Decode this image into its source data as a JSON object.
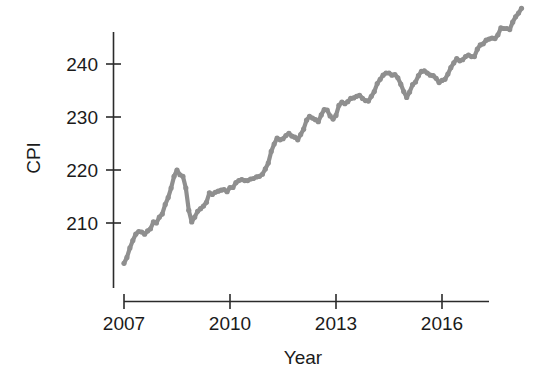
{
  "chart_data": {
    "type": "line",
    "title": "",
    "xlabel": "Year",
    "ylabel": "CPI",
    "xlim": [
      2006.92,
      2018.25
    ],
    "ylim": [
      201.0,
      247.2
    ],
    "grid": false,
    "legend": null,
    "series_color": "#8f8f8f",
    "axis_color": "#2b2b2b",
    "xticks": [
      2007,
      2010,
      2013,
      2016
    ],
    "xtick_labels": [
      "2007",
      "2010",
      "2013",
      "2016"
    ],
    "yticks": [
      210,
      220,
      230,
      240
    ],
    "ytick_labels": [
      "210",
      "220",
      "230",
      "240"
    ],
    "series": [
      {
        "name": "CPI",
        "x": [
          2007.0,
          2007.083,
          2007.167,
          2007.25,
          2007.333,
          2007.417,
          2007.5,
          2007.583,
          2007.667,
          2007.75,
          2007.833,
          2007.917,
          2008.0,
          2008.083,
          2008.167,
          2008.25,
          2008.333,
          2008.417,
          2008.5,
          2008.583,
          2008.667,
          2008.75,
          2008.833,
          2008.917,
          2009.0,
          2009.083,
          2009.167,
          2009.25,
          2009.333,
          2009.417,
          2009.5,
          2009.583,
          2009.667,
          2009.75,
          2009.833,
          2009.917,
          2010.0,
          2010.083,
          2010.167,
          2010.25,
          2010.333,
          2010.417,
          2010.5,
          2010.583,
          2010.667,
          2010.75,
          2010.833,
          2010.917,
          2011.0,
          2011.083,
          2011.167,
          2011.25,
          2011.333,
          2011.417,
          2011.5,
          2011.583,
          2011.667,
          2011.75,
          2011.833,
          2011.917,
          2012.0,
          2012.083,
          2012.167,
          2012.25,
          2012.333,
          2012.417,
          2012.5,
          2012.583,
          2012.667,
          2012.75,
          2012.833,
          2012.917,
          2013.0,
          2013.083,
          2013.167,
          2013.25,
          2013.333,
          2013.417,
          2013.5,
          2013.583,
          2013.667,
          2013.75,
          2013.833,
          2013.917,
          2014.0,
          2014.083,
          2014.167,
          2014.25,
          2014.333,
          2014.417,
          2014.5,
          2014.583,
          2014.667,
          2014.75,
          2014.833,
          2014.917,
          2015.0,
          2015.083,
          2015.167,
          2015.25,
          2015.333,
          2015.417,
          2015.5,
          2015.583,
          2015.667,
          2015.75,
          2015.833,
          2015.917,
          2016.0,
          2016.083,
          2016.167,
          2016.25,
          2016.333,
          2016.417,
          2016.5,
          2016.583,
          2016.667,
          2016.75,
          2016.833,
          2016.917,
          2017.0,
          2017.083,
          2017.167,
          2017.25,
          2017.333,
          2017.417,
          2017.5,
          2017.583,
          2017.667,
          2017.75,
          2017.833,
          2017.917,
          2018.0,
          2018.083,
          2018.167,
          2018.25
        ],
        "values": [
          202.4,
          203.5,
          205.3,
          206.7,
          207.9,
          208.4,
          208.3,
          207.9,
          208.5,
          208.9,
          210.2,
          210.0,
          211.1,
          211.7,
          213.5,
          214.8,
          216.6,
          218.8,
          220.0,
          219.1,
          218.8,
          216.6,
          212.4,
          210.2,
          211.1,
          212.2,
          212.7,
          213.2,
          213.9,
          215.7,
          215.4,
          215.8,
          216.0,
          216.2,
          216.3,
          215.9,
          216.7,
          216.7,
          217.6,
          218.0,
          218.2,
          218.0,
          218.0,
          218.3,
          218.4,
          218.7,
          218.8,
          219.2,
          220.2,
          221.3,
          223.5,
          224.9,
          226.0,
          225.7,
          225.9,
          226.5,
          226.9,
          226.4,
          226.2,
          225.7,
          226.7,
          227.7,
          229.4,
          230.1,
          229.8,
          229.5,
          229.1,
          230.4,
          231.4,
          231.3,
          230.2,
          229.6,
          230.3,
          232.2,
          232.8,
          232.5,
          232.9,
          233.5,
          233.6,
          233.9,
          234.1,
          233.5,
          233.1,
          233.0,
          233.9,
          234.8,
          236.3,
          237.1,
          237.9,
          238.3,
          238.3,
          237.9,
          238.0,
          237.4,
          236.2,
          234.8,
          233.7,
          234.7,
          236.1,
          236.6,
          237.8,
          238.6,
          238.7,
          238.3,
          237.9,
          237.8,
          237.3,
          236.5,
          236.9,
          237.1,
          238.1,
          239.3,
          240.2,
          241.0,
          240.6,
          240.8,
          241.4,
          241.7,
          241.4,
          241.4,
          242.8,
          243.6,
          243.8,
          244.5,
          244.7,
          244.9,
          244.8,
          245.5,
          246.8,
          246.7,
          246.7,
          246.5,
          247.9,
          248.9,
          249.6,
          250.5
        ]
      }
    ]
  },
  "axis": {
    "y_title": "CPI",
    "x_title": "Year",
    "y_tick_0": "210",
    "y_tick_1": "220",
    "y_tick_2": "230",
    "y_tick_3": "240",
    "x_tick_0": "2007",
    "x_tick_1": "2010",
    "x_tick_2": "2013",
    "x_tick_3": "2016"
  }
}
